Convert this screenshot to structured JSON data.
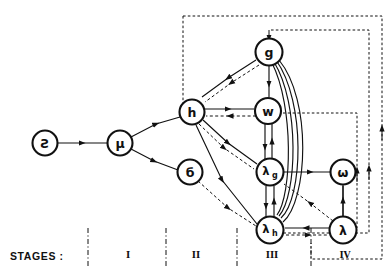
{
  "figure": {
    "type": "directed-graph-diagram",
    "background_color": "#ffffff",
    "line_color": "#111111",
    "width": 392,
    "height": 279
  },
  "caption": {
    "stages_label": "STAGES :"
  },
  "stages": [
    {
      "numeral": "I",
      "x": 128,
      "y": 250
    },
    {
      "numeral": "II",
      "x": 196,
      "y": 250
    },
    {
      "numeral": "III",
      "x": 272,
      "y": 250
    },
    {
      "numeral": "IV",
      "x": 345,
      "y": 250
    }
  ],
  "stage_dividers": [
    {
      "x": 88,
      "y1": 228,
      "y2": 268
    },
    {
      "x": 166,
      "y1": 228,
      "y2": 268
    },
    {
      "x": 237,
      "y1": 228,
      "y2": 268
    },
    {
      "x": 311,
      "y1": 228,
      "y2": 268
    }
  ],
  "nodes": [
    {
      "id": "zeta",
      "label": "Ƨ",
      "sub": "",
      "cx": 45,
      "cy": 143,
      "r": 12.5
    },
    {
      "id": "mu",
      "label": "μ",
      "sub": "",
      "cx": 120,
      "cy": 143,
      "r": 12.5
    },
    {
      "id": "sigma",
      "label": "б",
      "sub": "",
      "cx": 190,
      "cy": 172,
      "r": 12.5
    },
    {
      "id": "h",
      "label": "h",
      "sub": "",
      "cx": 192,
      "cy": 112,
      "r": 12.5
    },
    {
      "id": "g",
      "label": "g",
      "sub": "",
      "cx": 269,
      "cy": 52,
      "r": 13.5
    },
    {
      "id": "w",
      "label": "w",
      "sub": "",
      "cx": 268,
      "cy": 111,
      "r": 13.0
    },
    {
      "id": "lambda_g",
      "label": "λ",
      "sub": "g",
      "cx": 270,
      "cy": 172,
      "r": 13.5
    },
    {
      "id": "lambda_h",
      "label": "λ",
      "sub": "h",
      "cx": 270,
      "cy": 230,
      "r": 13.5
    },
    {
      "id": "omega",
      "label": "ω",
      "sub": "",
      "cx": 343,
      "cy": 172,
      "r": 12.5
    },
    {
      "id": "lambda",
      "label": "λ",
      "sub": "",
      "cx": 343,
      "cy": 230,
      "r": 13.5
    }
  ],
  "edges": [
    {
      "from": "zeta",
      "to": "mu",
      "style": "solid"
    },
    {
      "from": "mu",
      "to": "h",
      "style": "solid"
    },
    {
      "from": "mu",
      "to": "sigma",
      "style": "solid"
    },
    {
      "from": "g",
      "to": "h",
      "style": "solid"
    },
    {
      "from": "g",
      "to": "h",
      "style": "dashed"
    },
    {
      "from": "g",
      "to": "w",
      "style": "solid"
    },
    {
      "from": "g",
      "to": "lambda_g",
      "style": "solid"
    },
    {
      "from": "g",
      "to": "lambda_h",
      "style": "solid"
    },
    {
      "from": "h",
      "to": "w",
      "style": "solid"
    },
    {
      "from": "w",
      "to": "h",
      "style": "dashed"
    },
    {
      "from": "h",
      "to": "lambda_g",
      "style": "solid"
    },
    {
      "from": "h",
      "to": "lambda_g",
      "style": "dashed"
    },
    {
      "from": "h",
      "to": "lambda_h",
      "style": "solid"
    },
    {
      "from": "sigma",
      "to": "lambda_h",
      "style": "dashed"
    },
    {
      "from": "w",
      "to": "lambda_g",
      "style": "solid"
    },
    {
      "from": "lambda_g",
      "to": "w",
      "style": "solid"
    },
    {
      "from": "lambda_g",
      "to": "lambda_h",
      "style": "solid"
    },
    {
      "from": "lambda_h",
      "to": "lambda_g",
      "style": "solid"
    },
    {
      "from": "lambda_g",
      "to": "omega",
      "style": "solid"
    },
    {
      "from": "lambda_h",
      "to": "g",
      "style": "solid"
    },
    {
      "from": "lambda_h",
      "to": "w",
      "style": "solid"
    },
    {
      "from": "lambda",
      "to": "lambda_h",
      "style": "solid"
    },
    {
      "from": "lambda",
      "to": "omega",
      "style": "solid"
    },
    {
      "from": "lambda",
      "to": "lambda_g",
      "style": "dashed"
    },
    {
      "from": "lambda_h",
      "to": "lambda",
      "style": "dashed"
    }
  ],
  "boundaries": [
    {
      "id": "outer-region",
      "points": "183,16 388,16 388,258 311,258 311,240"
    },
    {
      "id": "inner-region",
      "points": "269,27 374,27 374,238 277,238"
    }
  ],
  "feedback_paths": [
    {
      "id": "feedback-to-g-outer",
      "label": ""
    },
    {
      "id": "feedback-to-omega",
      "label": ""
    },
    {
      "id": "feedback-to-lambda",
      "label": ""
    }
  ]
}
